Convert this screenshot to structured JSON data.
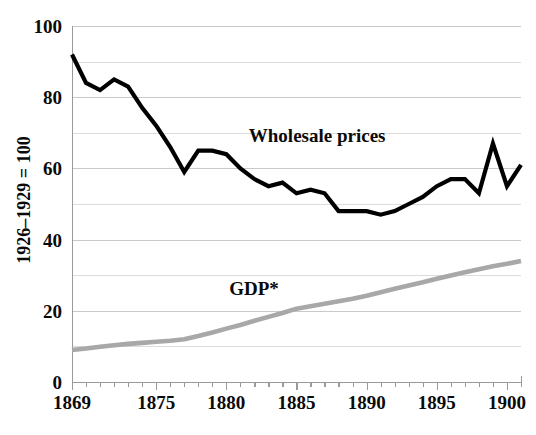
{
  "chart_data": {
    "type": "line",
    "title": "",
    "xlabel": "",
    "ylabel": "1926–1929 = 100",
    "xlim": [
      1869,
      1901
    ],
    "ylim": [
      0,
      100
    ],
    "y_ticks": [
      0,
      20,
      40,
      60,
      80,
      100
    ],
    "y_tick_labels": [
      "0",
      "20",
      "40",
      "60",
      "80",
      "100"
    ],
    "y_minor_gridlines": [
      10,
      30,
      50,
      70,
      90
    ],
    "x_ticks": [
      1869,
      1875,
      1880,
      1885,
      1890,
      1895,
      1900
    ],
    "x_tick_labels": [
      "1869",
      "1875",
      "1880",
      "1885",
      "1890",
      "1895",
      "1900"
    ],
    "grid": true,
    "legend": "inline-annotations",
    "x": [
      1869,
      1870,
      1871,
      1872,
      1873,
      1874,
      1875,
      1876,
      1877,
      1878,
      1879,
      1880,
      1881,
      1882,
      1883,
      1884,
      1885,
      1886,
      1887,
      1888,
      1889,
      1890,
      1891,
      1892,
      1893,
      1894,
      1895,
      1896,
      1897,
      1898,
      1899,
      1900,
      1901
    ],
    "series": [
      {
        "name": "Wholesale prices",
        "color": "#000000",
        "width": 4.2,
        "label_x": 1881.6,
        "label_y": 67.5,
        "values": [
          92,
          84,
          82,
          85,
          83,
          77,
          72,
          66,
          59,
          65,
          65,
          64,
          60,
          57,
          55,
          56,
          53,
          54,
          53,
          48,
          48,
          48,
          47,
          48,
          50,
          52,
          55,
          57,
          57,
          53,
          67,
          55,
          61
        ]
      },
      {
        "name": "GDP*",
        "color": "#a8a8a8",
        "width": 4.6,
        "label_x": 1880.2,
        "label_y": 24.5,
        "values": [
          9,
          9.4,
          9.9,
          10.3,
          10.7,
          11.0,
          11.3,
          11.6,
          12.0,
          12.9,
          13.9,
          15.0,
          16.0,
          17.2,
          18.3,
          19.4,
          20.6,
          21.3,
          22.0,
          22.7,
          23.4,
          24.2,
          25.2,
          26.2,
          27.1,
          28.0,
          29.0,
          29.9,
          30.8,
          31.7,
          32.5,
          33.2,
          34.0
        ]
      }
    ]
  },
  "axes": {
    "y_axis_label": "1926–1929 = 100"
  }
}
